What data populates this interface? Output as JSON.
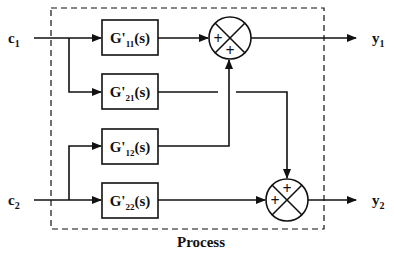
{
  "diagram": {
    "title": "Process",
    "inputs": [
      {
        "id": "c1",
        "base": "c",
        "sub": "1"
      },
      {
        "id": "c2",
        "base": "c",
        "sub": "2"
      }
    ],
    "outputs": [
      {
        "id": "y1",
        "base": "y",
        "sub": "1"
      },
      {
        "id": "y2",
        "base": "y",
        "sub": "2"
      }
    ],
    "blocks": [
      {
        "id": "G11",
        "base": "G'",
        "sub": "11",
        "suffix": "(s)"
      },
      {
        "id": "G21",
        "base": "G'",
        "sub": "21",
        "suffix": "(s)"
      },
      {
        "id": "G12",
        "base": "G'",
        "sub": "12",
        "suffix": "(s)"
      },
      {
        "id": "G22",
        "base": "G'",
        "sub": "22",
        "suffix": "(s)"
      }
    ],
    "summing_junctions": [
      {
        "id": "sum1",
        "signs": [
          "+",
          "+"
        ],
        "output": "y1"
      },
      {
        "id": "sum2",
        "signs": [
          "+",
          "+"
        ],
        "output": "y2"
      }
    ],
    "connections": [
      "c1 -> G11",
      "c1 -> G21",
      "c2 -> G12",
      "c2 -> G22",
      "G11 -> sum1",
      "G12 -> sum1",
      "G21 -> sum2",
      "G22 -> sum2",
      "sum1 -> y1",
      "sum2 -> y2"
    ]
  }
}
